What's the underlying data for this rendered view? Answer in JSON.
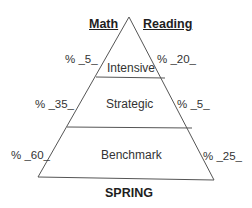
{
  "headers": {
    "left": "Math",
    "right": "Reading"
  },
  "tiers": [
    {
      "name": "Intensive",
      "math": "% _5_",
      "reading": "% _20_"
    },
    {
      "name": "Strategic",
      "math": "% _35_",
      "reading": "% _5_"
    },
    {
      "name": "Benchmark",
      "math": "% _60_",
      "reading": "% _25_"
    }
  ],
  "season": "SPRING",
  "colors": {
    "line": "#555555",
    "text": "#222222",
    "background": "#ffffff"
  }
}
